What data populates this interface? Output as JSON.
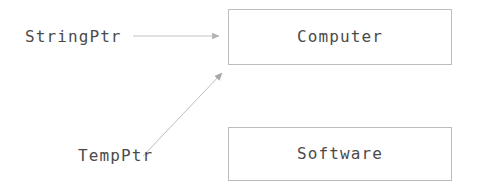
{
  "diagram": {
    "type": "pointer-reference-diagram",
    "background_color": "#ffffff",
    "stroke_color": "#b9b9b9",
    "text_color": "#4a4a4a",
    "box_border_color": "#bcbcbc",
    "box_fill_color": "#ffffff",
    "nodes": [
      {
        "id": "computer",
        "label": "Computer",
        "x": 228,
        "y": 9,
        "width": 224,
        "height": 56
      },
      {
        "id": "software",
        "label": "Software",
        "x": 228,
        "y": 127,
        "width": 224,
        "height": 54
      }
    ],
    "pointers": [
      {
        "id": "stringptr",
        "label": "StringPtr",
        "label_x": 25,
        "label_y": 29,
        "target": "computer",
        "arrow_style": "straight-horizontal",
        "from_x": 133,
        "from_y": 36,
        "to_x": 227,
        "to_y": 36
      },
      {
        "id": "tempptr",
        "label": "TempPtr",
        "label_x": 78,
        "label_y": 148,
        "target": "computer",
        "arrow_style": "diagonal",
        "from_x": 143,
        "from_y": 156,
        "to_x": 227,
        "to_y": 68
      }
    ]
  }
}
